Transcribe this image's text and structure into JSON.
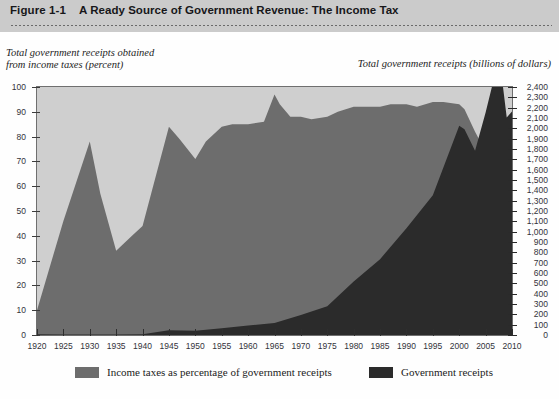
{
  "header": {
    "figure_number": "Figure 1-1",
    "title": "A Ready Source of Government Revenue: The Income Tax"
  },
  "axis_captions": {
    "left": "Total government receipts obtained\nfrom income taxes (percent)",
    "right": "Total government receipts (billions of dollars)"
  },
  "legend": {
    "items": [
      {
        "label": "Income taxes as percentage of government receipts",
        "color": "#6d6d6d",
        "swatch": "legend-swatch-percent"
      },
      {
        "label": "Government receipts",
        "color": "#2b2b2b",
        "swatch": "legend-swatch-receipts"
      }
    ]
  },
  "source_note": "",
  "colors": {
    "header_bg": "#cbcbcb",
    "plot_bg": "#efefef",
    "band": "#cfcfcf",
    "percent_area": "#6d6d6d",
    "receipts_area": "#2b2b2b",
    "frame": "#6f6f6f"
  },
  "chart_data": {
    "type": "area",
    "title": "A Ready Source of Government Revenue: The Income Tax",
    "xlabel": "",
    "x_ticks": [
      1920,
      1925,
      1930,
      1935,
      1940,
      1945,
      1950,
      1955,
      1960,
      1965,
      1970,
      1975,
      1980,
      1985,
      1990,
      1995,
      2000,
      2005,
      2010
    ],
    "xlim": [
      1920,
      2010
    ],
    "grid": "horizontal-bands",
    "legend_position": "bottom",
    "axes": [
      {
        "side": "left",
        "ylabel": "Total government receipts obtained from income taxes (percent)",
        "ylim": [
          0,
          100
        ],
        "ytick_step": 10,
        "y_ticks": [
          0,
          10,
          20,
          30,
          40,
          50,
          60,
          70,
          80,
          90,
          100
        ]
      },
      {
        "side": "right",
        "ylabel": "Total government receipts (billions of dollars)",
        "ylim": [
          0,
          2400
        ],
        "ytick_step": 100,
        "y_ticks": [
          0,
          100,
          200,
          300,
          400,
          500,
          600,
          700,
          800,
          900,
          1000,
          1100,
          1200,
          1300,
          1400,
          1500,
          1600,
          1700,
          1800,
          1900,
          2000,
          2100,
          2200,
          2300,
          2400
        ]
      }
    ],
    "series": [
      {
        "name": "Income taxes as percentage of government receipts",
        "axis": "left",
        "color": "#6d6d6d",
        "x": [
          1920,
          1925,
          1930,
          1932,
          1935,
          1938,
          1940,
          1942,
          1945,
          1947,
          1950,
          1952,
          1955,
          1957,
          1960,
          1963,
          1965,
          1966,
          1968,
          1970,
          1972,
          1975,
          1977,
          1980,
          1982,
          1985,
          1987,
          1990,
          1992,
          1995,
          1997,
          2000,
          2001,
          2003,
          2005,
          2007,
          2009,
          2010
        ],
        "values": [
          10,
          46,
          78,
          57,
          34,
          40,
          44,
          60,
          84,
          79,
          71,
          78,
          84,
          85,
          85,
          86,
          97,
          93,
          88,
          88,
          87,
          88,
          90,
          92,
          92,
          92,
          93,
          93,
          92,
          94,
          94,
          93,
          91,
          82,
          74,
          72,
          69,
          76
        ]
      },
      {
        "name": "Government receipts",
        "axis": "right",
        "color": "#2b2b2b",
        "x": [
          1920,
          1925,
          1930,
          1935,
          1940,
          1945,
          1950,
          1955,
          1960,
          1965,
          1970,
          1975,
          1980,
          1985,
          1990,
          1995,
          2000,
          2001,
          2003,
          2005,
          2007,
          2008,
          2009,
          2010
        ],
        "values": [
          7,
          4,
          5,
          4,
          7,
          45,
          40,
          66,
          92,
          117,
          193,
          279,
          517,
          734,
          1032,
          1352,
          2025,
          1991,
          1782,
          2154,
          2568,
          2524,
          2105,
          2163
        ]
      }
    ]
  }
}
